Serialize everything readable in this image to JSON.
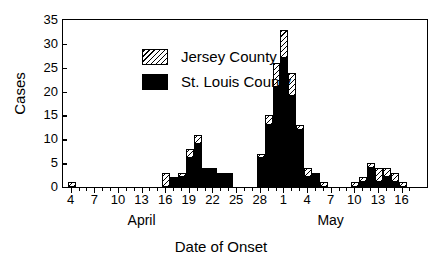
{
  "chart_data": {
    "type": "bar",
    "stacked": true,
    "title": "",
    "xlabel": "Date of Onset",
    "ylabel": "Cases",
    "ylim": [
      0,
      35
    ],
    "ytick_step": 5,
    "yticks": [
      0,
      5,
      10,
      15,
      20,
      25,
      30,
      35
    ],
    "grid": false,
    "legend_position": "top-left",
    "x_major_tick_labels": [
      "4",
      "7",
      "10",
      "13",
      "16",
      "19",
      "22",
      "25",
      "28",
      "1",
      "4",
      "7",
      "10",
      "13",
      "16"
    ],
    "month_labels": [
      {
        "label": "April",
        "category": "Apr 13"
      },
      {
        "label": "May",
        "category": "May 7"
      }
    ],
    "categories": [
      "Apr 4",
      "Apr 5",
      "Apr 6",
      "Apr 7",
      "Apr 8",
      "Apr 9",
      "Apr 10",
      "Apr 11",
      "Apr 12",
      "Apr 13",
      "Apr 14",
      "Apr 15",
      "Apr 16",
      "Apr 17",
      "Apr 18",
      "Apr 19",
      "Apr 20",
      "Apr 21",
      "Apr 22",
      "Apr 23",
      "Apr 24",
      "Apr 25",
      "Apr 26",
      "Apr 27",
      "Apr 28",
      "Apr 29",
      "Apr 30",
      "May 1",
      "May 2",
      "May 3",
      "May 4",
      "May 5",
      "May 6",
      "May 7",
      "May 8",
      "May 9",
      "May 10",
      "May 11",
      "May 12",
      "May 13",
      "May 14",
      "May 15",
      "May 16",
      "May 17"
    ],
    "series": [
      {
        "name": "St. Louis County",
        "color": "#000000",
        "pattern": "solid",
        "values": [
          0,
          0,
          0,
          0,
          0,
          0,
          0,
          0,
          0,
          0,
          0,
          0,
          0,
          2,
          2,
          6,
          9,
          4,
          4,
          3,
          3,
          0,
          0,
          0,
          6,
          13,
          21,
          27,
          19,
          12,
          2,
          3,
          0,
          0,
          0,
          0,
          0,
          1,
          4,
          1,
          2,
          1,
          0,
          0
        ]
      },
      {
        "name": "Jersey County",
        "color": "#ffffff",
        "pattern": "diagonal-hatch",
        "values": [
          1,
          0,
          0,
          0,
          0,
          0,
          0,
          0,
          0,
          0,
          0,
          0,
          3,
          0,
          1,
          2,
          2,
          0,
          0,
          0,
          0,
          0,
          0,
          0,
          1,
          2,
          5,
          6,
          5,
          1,
          2,
          0,
          1,
          0,
          0,
          0,
          1,
          1,
          1,
          3,
          2,
          2,
          1,
          0
        ]
      }
    ]
  },
  "legend": {
    "items": [
      {
        "label": "Jersey County",
        "pattern": "hatch"
      },
      {
        "label": "St. Louis County",
        "pattern": "solid"
      }
    ]
  },
  "axes": {
    "y_title": "Cases",
    "x_title": "Date of Onset"
  }
}
